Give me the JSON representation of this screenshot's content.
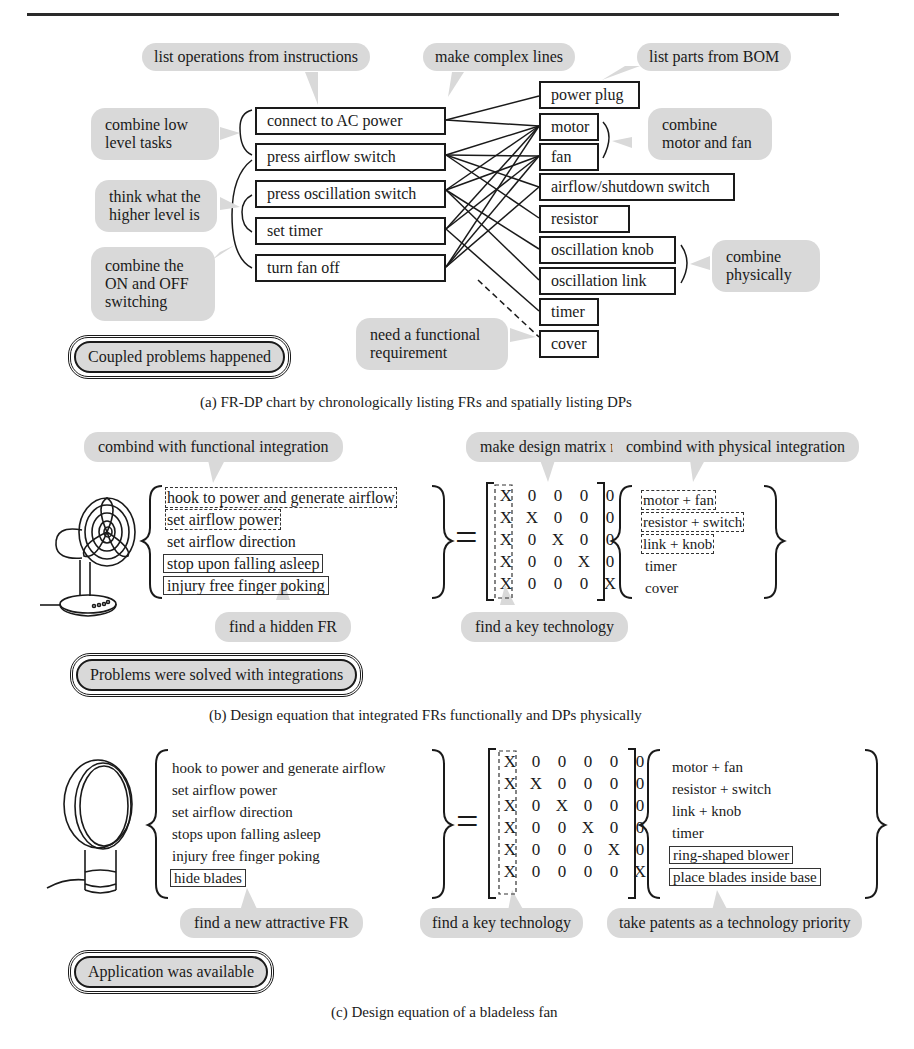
{
  "panel_a": {
    "caption": "(a) FR-DP chart by chronologically listing FRs and spatially listing DPs",
    "callouts": {
      "list_operations": "list operations from instructions",
      "complex_lines": "make complex lines",
      "list_parts": "list parts from BOM",
      "combine_low_level": "combine low level tasks",
      "think_higher": "think what the higher level is",
      "combine_on_off": "combine the ON and OFF switching",
      "combine_motor_fan": "combine motor and fan",
      "combine_physically": "combine physically",
      "need_fr": "need a functional requirement"
    },
    "functional_requirements": [
      "connect to AC power",
      "press airflow switch",
      "press oscillation switch",
      "set timer",
      "turn fan off"
    ],
    "design_parameters": [
      "power plug",
      "motor",
      "fan",
      "airflow/shutdown switch",
      "resistor",
      "oscillation knob",
      "oscillation link",
      "timer",
      "cover"
    ],
    "status": "Coupled problems happened"
  },
  "panel_b": {
    "caption": "(b) Design equation that integrated FRs functionally and DPs physically",
    "callouts": {
      "functional_integration": "combind with functional integration",
      "matrix_regular": "make design matrix regular",
      "physical_integration": "combind with physical integration",
      "hidden_fr": "find a hidden FR",
      "key_technology": "find a key technology"
    },
    "frs": [
      "hook to power and generate airflow",
      "set airflow power",
      "set airflow direction",
      "stop upon falling asleep",
      "injury free finger poking"
    ],
    "equals": "=",
    "matrix": [
      [
        "X",
        "0",
        "0",
        "0",
        "0"
      ],
      [
        "X",
        "X",
        "0",
        "0",
        "0"
      ],
      [
        "X",
        "0",
        "X",
        "0",
        "0"
      ],
      [
        "X",
        "0",
        "0",
        "X",
        "0"
      ],
      [
        "X",
        "0",
        "0",
        "0",
        "X"
      ]
    ],
    "dps": [
      "motor + fan",
      "resistor + switch",
      "link + knob",
      "timer",
      "cover"
    ],
    "status": "Problems were solved with integrations"
  },
  "panel_c": {
    "caption": "(c) Design equation of a bladeless fan",
    "callouts": {
      "new_fr": "find a new attractive FR",
      "key_technology": "find a key technology",
      "patents": "take patents as a technology priority"
    },
    "frs": [
      "hook to power and generate airflow",
      "set airflow power",
      "set airflow direction",
      "stops upon falling asleep",
      "injury free finger poking",
      "hide blades"
    ],
    "equals": "=",
    "matrix": [
      [
        "X",
        "0",
        "0",
        "0",
        "0",
        "0"
      ],
      [
        "X",
        "X",
        "0",
        "0",
        "0",
        "0"
      ],
      [
        "X",
        "0",
        "X",
        "0",
        "0",
        "0"
      ],
      [
        "X",
        "0",
        "0",
        "X",
        "0",
        "0"
      ],
      [
        "X",
        "0",
        "0",
        "0",
        "X",
        "0"
      ],
      [
        "X",
        "0",
        "0",
        "0",
        "0",
        "X"
      ]
    ],
    "dps": [
      "motor + fan",
      "resistor + switch",
      "link + knob",
      "timer",
      "ring-shaped blower",
      "place blades inside base"
    ],
    "status": "Application was available"
  },
  "colors": {
    "bubble_fill": "#d9d9d9",
    "ink": "#1a1a1a",
    "background": "#ffffff"
  }
}
